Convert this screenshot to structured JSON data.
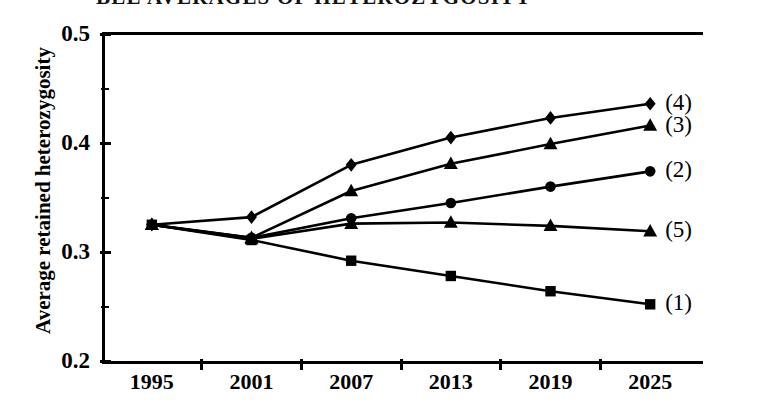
{
  "figure": {
    "title_partial": "BLE  AVERAGES  OF  HETEROZYGOSITY",
    "background_color": "#ffffff",
    "ink_color": "#000000"
  },
  "axes": {
    "y_title": "Average retained heterozygosity",
    "y_major_ticks": [
      "0.5",
      "0.4",
      "0.3",
      "0.2"
    ],
    "y_minor_tick_values": [
      0.45,
      0.35,
      0.25
    ],
    "x_ticks": [
      "1995",
      "2001",
      "2007",
      "2013",
      "2019",
      "2025"
    ]
  },
  "series_labels": {
    "s1": "(1)",
    "s2": "(2)",
    "s3": "(3)",
    "s4": "(4)",
    "s5": "(5)"
  },
  "chart_data": {
    "type": "line",
    "title": "",
    "xlabel": "",
    "ylabel": "Average retained heterozygosity",
    "x": [
      1995,
      2001,
      2007,
      2013,
      2019,
      2025
    ],
    "xlim": [
      1992,
      2028
    ],
    "ylim": [
      0.2,
      0.5
    ],
    "ytick_values": [
      0.2,
      0.3,
      0.4,
      0.5
    ],
    "yminor_tick_values": [
      0.25,
      0.35,
      0.45
    ],
    "grid": false,
    "legend_position": "right-of-last-point",
    "series": [
      {
        "name": "(4)",
        "marker": "diamond",
        "values": [
          0.325,
          0.332,
          0.38,
          0.405,
          0.423,
          0.436
        ]
      },
      {
        "name": "(3)",
        "marker": "triangle",
        "values": [
          0.325,
          0.313,
          0.356,
          0.381,
          0.399,
          0.416
        ]
      },
      {
        "name": "(2)",
        "marker": "circle",
        "values": [
          0.325,
          0.313,
          0.331,
          0.345,
          0.36,
          0.374
        ]
      },
      {
        "name": "(5)",
        "marker": "triangle",
        "values": [
          0.325,
          0.312,
          0.326,
          0.327,
          0.324,
          0.319
        ]
      },
      {
        "name": "(1)",
        "marker": "square",
        "values": [
          0.325,
          0.311,
          0.292,
          0.278,
          0.264,
          0.252
        ]
      }
    ]
  }
}
